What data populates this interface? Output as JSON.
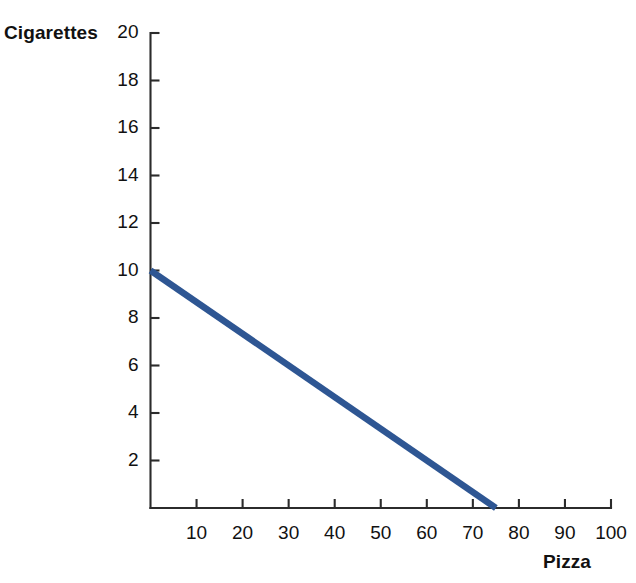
{
  "chart_data": {
    "type": "line",
    "title": "",
    "subtitle": "",
    "xlabel": "Pizza",
    "ylabel": "Cigarettes",
    "xlim": [
      0,
      100
    ],
    "ylim": [
      0,
      20
    ],
    "xticks": [
      10,
      20,
      30,
      40,
      50,
      60,
      70,
      80,
      90,
      100
    ],
    "yticks": [
      2,
      4,
      6,
      8,
      10,
      12,
      14,
      16,
      18,
      20
    ],
    "xtick_labels": [
      "10",
      "20",
      "30",
      "40",
      "50",
      "60",
      "70",
      "80",
      "90",
      "100"
    ],
    "ytick_labels": [
      "2",
      "4",
      "6",
      "8",
      "10",
      "12",
      "14",
      "16",
      "18",
      "20"
    ],
    "grid": false,
    "legend": null,
    "legend_position": "none",
    "series": [
      {
        "name": "Budget constraint",
        "color": "#2e5693",
        "linewidth": 6.5,
        "x": [
          0,
          75
        ],
        "y": [
          10,
          0
        ]
      }
    ],
    "annotations": []
  },
  "axis_titles": {
    "y": "Cigarettes",
    "x": "Pizza"
  },
  "colors": {
    "line": "#2e5693",
    "axis": "#2b2b2b",
    "text": "#111111",
    "background": "#ffffff"
  }
}
